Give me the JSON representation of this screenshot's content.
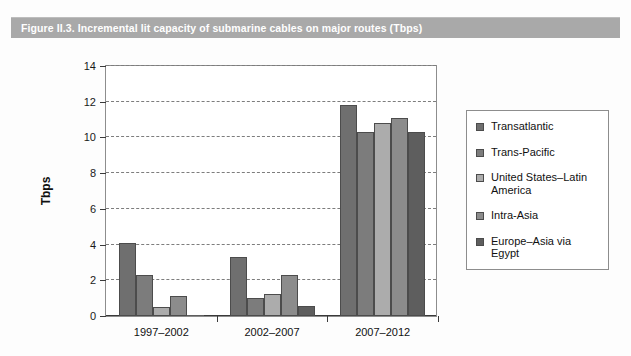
{
  "figure": {
    "title": "Figure II.3.   Incremental lit capacity of submarine cables on major routes (Tbps)",
    "title_bar_color": "#a9a9a9",
    "title_text_color": "#ffffff"
  },
  "chart_data": {
    "type": "bar",
    "title": "Incremental lit capacity of submarine cables on major routes (Tbps)",
    "xlabel": "",
    "ylabel": "Tbps",
    "ylim": [
      0,
      14
    ],
    "ytick_values": [
      0,
      2,
      4,
      6,
      8,
      10,
      12,
      14
    ],
    "ytick_labels": [
      "0",
      "2",
      "4",
      "6",
      "8",
      "10",
      "12",
      "14"
    ],
    "grid": true,
    "legend_position": "right",
    "categories": [
      "1997–2002",
      "2002–2007",
      "2007–2012"
    ],
    "series": [
      {
        "name": "Transatlantic",
        "color": "#6f6f6f",
        "values": [
          4.05,
          3.3,
          11.7
        ]
      },
      {
        "name": "Trans-Pacific",
        "color": "#7c7c7c",
        "values": [
          2.3,
          1.0,
          10.2
        ]
      },
      {
        "name": "United States–Latin America",
        "color": "#acacac",
        "values": [
          0.5,
          1.25,
          10.7
        ]
      },
      {
        "name": "Intra-Asia",
        "color": "#8c8c8c",
        "values": [
          1.1,
          2.3,
          11.0
        ]
      },
      {
        "name": "Europe–Asia via Egypt",
        "color": "#5e5e5e",
        "values": [
          0.05,
          0.55,
          10.2
        ]
      }
    ]
  }
}
